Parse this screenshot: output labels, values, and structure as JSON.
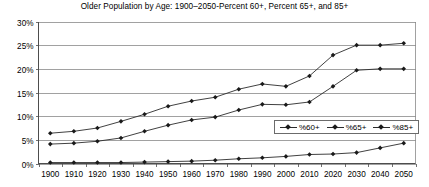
{
  "chart_data": {
    "type": "line",
    "title": "Older Population by Age: 1900–2050-Percent 60+, Percent 65+, and 85+",
    "xlabel": "",
    "ylabel": "",
    "categories": [
      "1900",
      "1910",
      "1920",
      "1930",
      "1940",
      "1950",
      "1960",
      "1970",
      "1980",
      "1990",
      "2000",
      "2010",
      "2020",
      "2030",
      "2040",
      "2050"
    ],
    "ylim": [
      0,
      30
    ],
    "ytick_labels": [
      "0%",
      "5%",
      "10%",
      "15%",
      "20%",
      "25%",
      "30%"
    ],
    "ytick_values": [
      0,
      5,
      10,
      15,
      20,
      25,
      30
    ],
    "grid": true,
    "legend_position": "inside-right",
    "series": [
      {
        "name": "%60+",
        "values": [
          6.4,
          6.8,
          7.5,
          8.9,
          10.4,
          12.1,
          13.2,
          14.0,
          15.7,
          16.8,
          16.3,
          18.5,
          22.9,
          25.0,
          25.0,
          25.4
        ]
      },
      {
        "name": "%65+",
        "values": [
          4.1,
          4.3,
          4.7,
          5.4,
          6.8,
          8.1,
          9.2,
          9.8,
          11.3,
          12.5,
          12.4,
          13.0,
          16.3,
          19.7,
          20.0,
          20.0
        ]
      },
      {
        "name": "%85+",
        "values": [
          0.2,
          0.2,
          0.2,
          0.2,
          0.3,
          0.4,
          0.5,
          0.7,
          1.0,
          1.2,
          1.5,
          1.9,
          2.0,
          2.3,
          3.3,
          4.3
        ]
      }
    ]
  },
  "legend": {
    "entries": [
      "%60+",
      "%65+",
      "%85+"
    ]
  }
}
